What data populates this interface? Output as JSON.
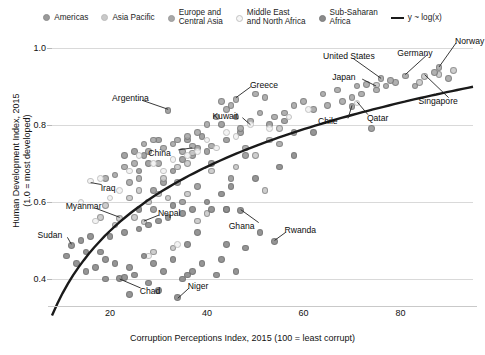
{
  "legend": {
    "items": [
      {
        "label": "Americas",
        "color": "#9a9a9a",
        "icon": "circle-marker"
      },
      {
        "label": "Asia Pacific",
        "color": "#c9c9c9",
        "icon": "circle-marker"
      },
      {
        "label": "Europe and\nCentral Asia",
        "color": "#a8a8a8",
        "icon": "circle-marker"
      },
      {
        "label": "Middle East\nand North Africa",
        "color": "#f2f2f2",
        "icon": "circle-marker"
      },
      {
        "label": "Sub-Saharan\nAfrica",
        "color": "#8a8a8a",
        "icon": "circle-marker"
      }
    ],
    "trend": {
      "label": "y ~ log(x)",
      "icon": "line-swatch",
      "color": "#1a1a1a"
    }
  },
  "chart_data": {
    "type": "scatter",
    "title": "",
    "xlabel": "Corruption Perceptions Index, 2015 (100 = least corrupt)",
    "ylabel": "Human Development Index, 2015\n(1.0 = most developed)",
    "xlim": [
      8,
      95
    ],
    "ylim": [
      0.33,
      1.03
    ],
    "xticks": [
      20,
      40,
      60,
      80
    ],
    "yticks": [
      0.4,
      0.6,
      0.8,
      1.0
    ],
    "grid": true,
    "legend_position": "top",
    "trendline": {
      "form": "y ~ log(x)",
      "color": "#1a1a1a"
    },
    "annotations": [
      {
        "label": "Norway",
        "x": 88,
        "y": 0.95
      },
      {
        "label": "United States",
        "x": 76,
        "y": 0.92
      },
      {
        "label": "Germany",
        "x": 81,
        "y": 0.93
      },
      {
        "label": "Japan",
        "x": 75,
        "y": 0.9
      },
      {
        "label": "Singapore",
        "x": 85,
        "y": 0.93
      },
      {
        "label": "Qatar",
        "x": 71,
        "y": 0.86
      },
      {
        "label": "Chile",
        "x": 70,
        "y": 0.85
      },
      {
        "label": "Greece",
        "x": 46,
        "y": 0.87
      },
      {
        "label": "Kuwait",
        "x": 49,
        "y": 0.8
      },
      {
        "label": "Argentina",
        "x": 32,
        "y": 0.84
      },
      {
        "label": "China",
        "x": 37,
        "y": 0.74
      },
      {
        "label": "Iraq",
        "x": 16,
        "y": 0.65
      },
      {
        "label": "Myanmar",
        "x": 22,
        "y": 0.56
      },
      {
        "label": "Nepal",
        "x": 27,
        "y": 0.55
      },
      {
        "label": "Sudan",
        "x": 12,
        "y": 0.49
      },
      {
        "label": "Ghana",
        "x": 47,
        "y": 0.58
      },
      {
        "label": "Rwanda",
        "x": 54,
        "y": 0.5
      },
      {
        "label": "Chad",
        "x": 22,
        "y": 0.4
      },
      {
        "label": "Niger",
        "x": 34,
        "y": 0.35
      }
    ],
    "series": [
      {
        "name": "Americas",
        "color": "#9a9a9a",
        "points": [
          [
            32,
            0.836
          ],
          [
            30,
            0.76
          ],
          [
            36,
            0.76
          ],
          [
            38,
            0.74
          ],
          [
            37,
            0.72
          ],
          [
            35,
            0.71
          ],
          [
            27,
            0.72
          ],
          [
            28,
            0.7
          ],
          [
            33,
            0.68
          ],
          [
            31,
            0.65
          ],
          [
            29,
            0.63
          ],
          [
            70,
            0.847
          ],
          [
            47,
            0.78
          ],
          [
            44,
            0.76
          ],
          [
            40,
            0.73
          ],
          [
            39,
            0.77
          ],
          [
            43,
            0.8
          ],
          [
            46,
            0.82
          ],
          [
            53,
            0.8
          ],
          [
            56,
            0.81
          ],
          [
            25,
            0.73
          ],
          [
            23,
            0.72
          ],
          [
            26,
            0.68
          ],
          [
            34,
            0.65
          ],
          [
            38,
            0.64
          ],
          [
            41,
            0.7
          ],
          [
            48,
            0.72
          ],
          [
            45,
            0.66
          ],
          [
            58,
            0.78
          ],
          [
            74,
            0.79
          ],
          [
            35,
            0.6
          ],
          [
            29,
            0.58
          ]
        ]
      },
      {
        "name": "Asia Pacific",
        "color": "#c9c9c9",
        "points": [
          [
            75,
            0.903
          ],
          [
            85,
            0.925
          ],
          [
            91,
            0.94
          ],
          [
            88,
            0.93
          ],
          [
            84,
            0.91
          ],
          [
            55,
            0.79
          ],
          [
            53,
            0.76
          ],
          [
            50,
            0.72
          ],
          [
            46,
            0.69
          ],
          [
            41,
            0.68
          ],
          [
            37,
            0.727
          ],
          [
            36,
            0.7
          ],
          [
            34,
            0.69
          ],
          [
            31,
            0.66
          ],
          [
            28,
            0.6
          ],
          [
            27,
            0.548
          ],
          [
            25,
            0.56
          ],
          [
            22,
            0.556
          ],
          [
            21,
            0.54
          ],
          [
            18,
            0.56
          ],
          [
            38,
            0.55
          ],
          [
            40,
            0.57
          ],
          [
            44,
            0.58
          ],
          [
            52,
            0.63
          ],
          [
            30,
            0.62
          ],
          [
            32,
            0.61
          ],
          [
            26,
            0.63
          ],
          [
            24,
            0.61
          ],
          [
            19,
            0.59
          ],
          [
            33,
            0.48
          ],
          [
            29,
            0.47
          ],
          [
            36,
            0.62
          ]
        ]
      },
      {
        "name": "Europe and Central Asia",
        "color": "#a8a8a8",
        "points": [
          [
            88,
            0.949
          ],
          [
            81,
            0.926
          ],
          [
            87,
            0.935
          ],
          [
            90,
            0.92
          ],
          [
            83,
            0.9
          ],
          [
            79,
            0.91
          ],
          [
            77,
            0.9
          ],
          [
            75,
            0.89
          ],
          [
            72,
            0.88
          ],
          [
            70,
            0.87
          ],
          [
            68,
            0.86
          ],
          [
            65,
            0.85
          ],
          [
            62,
            0.84
          ],
          [
            60,
            0.86
          ],
          [
            58,
            0.85
          ],
          [
            56,
            0.83
          ],
          [
            54,
            0.82
          ],
          [
            51,
            0.83
          ],
          [
            49,
            0.81
          ],
          [
            47,
            0.79
          ],
          [
            46,
            0.866
          ],
          [
            44,
            0.84
          ],
          [
            42,
            0.82
          ],
          [
            40,
            0.8
          ],
          [
            38,
            0.78
          ],
          [
            36,
            0.77
          ],
          [
            34,
            0.76
          ],
          [
            33,
            0.75
          ],
          [
            31,
            0.74
          ],
          [
            29,
            0.76
          ],
          [
            28,
            0.73
          ],
          [
            27,
            0.75
          ],
          [
            25,
            0.7
          ],
          [
            23,
            0.69
          ],
          [
            21,
            0.67
          ],
          [
            43,
            0.86
          ],
          [
            45,
            0.85
          ],
          [
            50,
            0.88
          ],
          [
            52,
            0.87
          ],
          [
            64,
            0.88
          ],
          [
            67,
            0.89
          ],
          [
            71,
            0.9
          ],
          [
            73,
            0.905
          ],
          [
            76,
            0.92
          ],
          [
            78,
            0.915
          ],
          [
            55,
            0.75
          ],
          [
            48,
            0.74
          ],
          [
            41,
            0.745
          ],
          [
            37,
            0.745
          ],
          [
            35,
            0.73
          ],
          [
            30,
            0.7
          ],
          [
            26,
            0.66
          ],
          [
            24,
            0.65
          ],
          [
            19,
            0.66
          ]
        ]
      },
      {
        "name": "Middle East and North Africa",
        "color": "#f2f2f2",
        "points": [
          [
            71,
            0.856
          ],
          [
            61,
            0.84
          ],
          [
            49,
            0.8
          ],
          [
            44,
            0.78
          ],
          [
            46,
            0.77
          ],
          [
            40,
            0.76
          ],
          [
            38,
            0.73
          ],
          [
            36,
            0.72
          ],
          [
            33,
            0.71
          ],
          [
            29,
            0.7
          ],
          [
            26,
            0.72
          ],
          [
            24,
            0.68
          ],
          [
            18,
            0.66
          ],
          [
            16,
            0.654
          ],
          [
            14,
            0.6
          ],
          [
            22,
            0.63
          ],
          [
            20,
            0.61
          ],
          [
            17,
            0.55
          ],
          [
            31,
            0.68
          ],
          [
            42,
            0.74
          ],
          [
            34,
            0.49
          ],
          [
            28,
            0.46
          ],
          [
            53,
            0.79
          ],
          [
            57,
            0.82
          ]
        ]
      },
      {
        "name": "Sub-Saharan Africa",
        "color": "#8a8a8a",
        "points": [
          [
            54,
            0.498
          ],
          [
            47,
            0.578
          ],
          [
            22,
            0.402
          ],
          [
            23,
            0.403
          ],
          [
            34,
            0.352
          ],
          [
            44,
            0.58
          ],
          [
            41,
            0.58
          ],
          [
            38,
            0.52
          ],
          [
            36,
            0.49
          ],
          [
            33,
            0.45
          ],
          [
            31,
            0.42
          ],
          [
            29,
            0.44
          ],
          [
            27,
            0.46
          ],
          [
            25,
            0.41
          ],
          [
            24,
            0.43
          ],
          [
            21,
            0.44
          ],
          [
            19,
            0.45
          ],
          [
            18,
            0.47
          ],
          [
            17,
            0.43
          ],
          [
            15,
            0.42
          ],
          [
            13,
            0.44
          ],
          [
            12,
            0.487
          ],
          [
            14,
            0.5
          ],
          [
            16,
            0.51
          ],
          [
            20,
            0.51
          ],
          [
            23,
            0.52
          ],
          [
            26,
            0.53
          ],
          [
            28,
            0.54
          ],
          [
            30,
            0.55
          ],
          [
            32,
            0.56
          ],
          [
            35,
            0.57
          ],
          [
            37,
            0.58
          ],
          [
            40,
            0.6
          ],
          [
            43,
            0.62
          ],
          [
            45,
            0.64
          ],
          [
            50,
            0.66
          ],
          [
            55,
            0.69
          ],
          [
            58,
            0.72
          ],
          [
            62,
            0.78
          ],
          [
            28,
            0.39
          ],
          [
            35,
            0.4
          ],
          [
            42,
            0.41
          ],
          [
            46,
            0.42
          ],
          [
            48,
            0.48
          ],
          [
            39,
            0.44
          ],
          [
            37,
            0.42
          ],
          [
            30,
            0.37
          ],
          [
            24,
            0.36
          ],
          [
            33,
            0.59
          ],
          [
            36,
            0.41
          ],
          [
            43,
            0.45
          ],
          [
            51,
            0.52
          ],
          [
            44,
            0.49
          ],
          [
            26,
            0.58
          ],
          [
            19,
            0.4
          ],
          [
            15,
            0.47
          ],
          [
            11,
            0.46
          ]
        ]
      }
    ]
  }
}
